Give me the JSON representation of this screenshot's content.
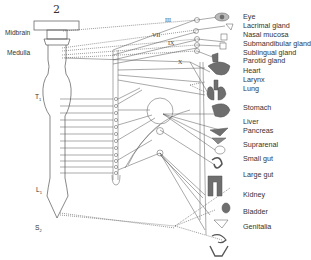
{
  "figure": {
    "number": "2"
  },
  "cns_regions": {
    "midbrain": "Midbrain",
    "medulla": "Medulla",
    "t1": "T",
    "t1_sub": "1",
    "l1": "L",
    "l1_sub": "1",
    "s2": "S",
    "s2_sub": "2"
  },
  "cranial_nerves": {
    "n3": "III",
    "n7": "VII",
    "n9": "IX",
    "n10": "X"
  },
  "organs": [
    {
      "label": "Eye",
      "icon": "eye-icon"
    },
    {
      "label": "Lacrimal gland",
      "icon": "lacrimal-gland-icon"
    },
    {
      "label": "Nasal mucosa",
      "icon": "nasal-mucosa-icon"
    },
    {
      "label": "Submandibular gland",
      "icon": "submandibular-gland-icon"
    },
    {
      "label": "Sublingual gland",
      "icon": "sublingual-gland-icon"
    },
    {
      "label": "Parotid gland",
      "icon": "parotid-gland-icon"
    },
    {
      "label": "Heart",
      "icon": "heart-icon"
    },
    {
      "label": "Larynx",
      "icon": "larynx-icon"
    },
    {
      "label": "Lung",
      "icon": "lung-icon"
    },
    {
      "label": "Stomach",
      "icon": "stomach-icon"
    },
    {
      "label": "Liver",
      "icon": "liver-icon"
    },
    {
      "label": "Pancreas",
      "icon": "pancreas-icon"
    },
    {
      "label": "Suprarenal",
      "icon": "suprarenal-icon"
    },
    {
      "label": "Small gut",
      "icon": "small-gut-icon"
    },
    {
      "label": "Large gut",
      "icon": "large-gut-icon"
    },
    {
      "label": "Kidney",
      "icon": "kidney-icon"
    },
    {
      "label": "Bladder",
      "icon": "bladder-icon"
    },
    {
      "label": "Genitalia",
      "icon": "genitalia-icon"
    }
  ],
  "colors": {
    "line": "#444444",
    "organ_fill": "#6e6e6e",
    "label": "#333333"
  }
}
